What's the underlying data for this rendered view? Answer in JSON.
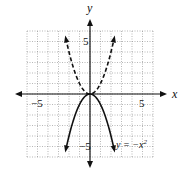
{
  "chart_data": {
    "type": "line",
    "title": "",
    "xlabel": "x",
    "ylabel": "y",
    "xlim": [
      -6,
      6
    ],
    "ylim": [
      -6,
      6
    ],
    "grid": true,
    "grid_style": "dotted",
    "tick_labels": {
      "x": [
        "-5",
        "5"
      ],
      "y": [
        "5",
        "-5"
      ]
    },
    "series": [
      {
        "name": "y = x^2",
        "style": "dashed",
        "x": [
          -2.3,
          -2,
          -1.5,
          -1,
          -0.5,
          0,
          0.5,
          1,
          1.5,
          2,
          2.3
        ],
        "y": [
          5.29,
          4,
          2.25,
          1,
          0.25,
          0,
          0.25,
          1,
          2.25,
          4,
          5.29
        ]
      },
      {
        "name": "y = -x^2",
        "style": "solid",
        "x": [
          -2.3,
          -2,
          -1.5,
          -1,
          -0.5,
          0,
          0.5,
          1,
          1.5,
          2,
          2.3
        ],
        "y": [
          -5.29,
          -4,
          -2.25,
          -1,
          -0.25,
          0,
          -0.25,
          -1,
          -2.25,
          -4,
          -5.29
        ]
      }
    ],
    "annotations": [
      {
        "text": "y = -x²",
        "x": 2.6,
        "y": -4.5
      }
    ]
  },
  "labels": {
    "x_axis": "x",
    "y_axis": "y",
    "x_tick_neg": "−5",
    "x_tick_pos": "5",
    "y_tick_pos": "5",
    "y_tick_neg": "−5",
    "curve_annotation_prefix": "y = −x",
    "curve_annotation_exp": "2"
  },
  "colors": {
    "ink": "#111111",
    "grid": "#888888",
    "background": "#ffffff"
  }
}
